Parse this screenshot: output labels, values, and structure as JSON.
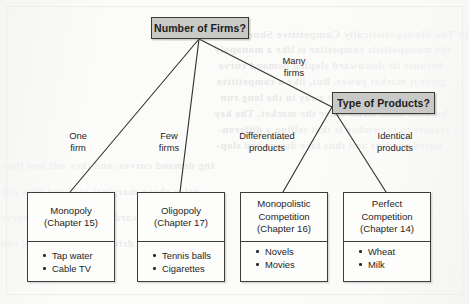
{
  "figure": {
    "type": "tree-diagram"
  },
  "nodes": {
    "root": {
      "label": "Number of Firms?"
    },
    "branch": {
      "label": "Type of Products?"
    }
  },
  "edge_labels": {
    "one_firm": "One\nfirm",
    "few_firms": "Few\nfirms",
    "many_firms": "Many\nfirms",
    "differentiated": "Differentiated\nproducts",
    "identical": "Identical\nproducts"
  },
  "leaves": [
    {
      "title": "Monopoly",
      "chapter": "(Chapter 15)",
      "examples": [
        "Tap water",
        "Cable TV"
      ]
    },
    {
      "title": "Oligopoly",
      "chapter": "(Chapter 17)",
      "examples": [
        "Tennis balls",
        "Cigarettes"
      ]
    },
    {
      "title": "Monopolistic\nCompetition",
      "title_line1": "Monopolistic",
      "title_line2": "Competition",
      "chapter": "(Chapter 16)",
      "examples": [
        "Novels",
        "Movies"
      ]
    },
    {
      "title": "Perfect\nCompetition",
      "title_line1": "Perfect",
      "title_line2": "Competition",
      "chapter": "(Chapter 14)",
      "examples": [
        "Wheat",
        "Milk"
      ]
    }
  ],
  "colors": {
    "node_fill": "#c9c9c7",
    "node_border": "#3a3a38",
    "leaf_fill": "#fdfdfc",
    "leaf_border": "#3c3c3a",
    "connector": "#33332f",
    "paper": "#fbfbfa"
  },
  "bleed_through": {
    "lines": [
      "20 The Monopolistically Competitive Short Run",
      "the monopolistic competitor is like a monopoly",
      "because its downward sloping demand curve",
      "gives it market power. But, like a competitive",
      "firm, its profits drive away in the long run",
      "because other firms enter the market. The key",
      "feature to remember is that selling a differen-",
      "tiated product and thus face downward slop-",
      "ing demand curves, and they sell and thus",
      "price above marginal cost and thus sell"
    ]
  }
}
